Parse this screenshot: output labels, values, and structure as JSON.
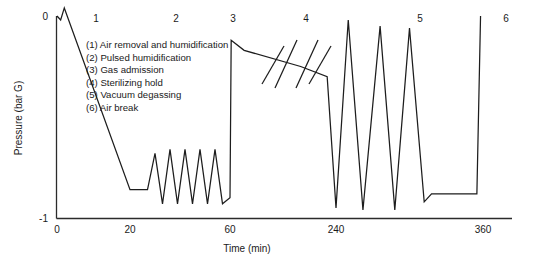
{
  "chart_data": {
    "type": "line",
    "title": "",
    "xlabel": "Time (min)",
    "ylabel": "Pressure (bar G)",
    "ylim": [
      -1,
      0
    ],
    "ytick_labels": [
      "0",
      "-1"
    ],
    "ytick_values": [
      0,
      -1
    ],
    "xtick_labels": [
      "0",
      "20",
      "60",
      "240",
      "360"
    ],
    "xtick_values": [
      0,
      20,
      60,
      240,
      360
    ],
    "grid": false,
    "legend_position": "inside-top-left",
    "axis_break": {
      "present": true,
      "axis": "x",
      "region_label": "4",
      "note": "double slash break symbol drawn across the sterilizing hold plateau"
    },
    "phase_labels": [
      {
        "id": "1",
        "x": 20
      },
      {
        "id": "2",
        "x": 40
      },
      {
        "id": "3",
        "x": 58
      },
      {
        "id": "4",
        "x": 140
      },
      {
        "id": "5",
        "x": 285
      },
      {
        "id": "6",
        "x": 358
      }
    ],
    "legend_entries": [
      "(1) Air removal and humidification",
      "(2) Pulsed humidification",
      "(3) Gas admission",
      "(4) Sterilizing hold",
      "(5) Vacuum degassing",
      "(6) Air break"
    ],
    "series": [
      {
        "name": "Pressure",
        "points": [
          [
            0,
            0.0
          ],
          [
            1,
            -0.02
          ],
          [
            2,
            0.04
          ],
          [
            20,
            -0.86
          ],
          [
            27,
            -0.86
          ],
          [
            30,
            -0.68
          ],
          [
            33,
            -0.93
          ],
          [
            36,
            -0.66
          ],
          [
            39,
            -0.93
          ],
          [
            42,
            -0.66
          ],
          [
            45,
            -0.93
          ],
          [
            48,
            -0.66
          ],
          [
            51,
            -0.93
          ],
          [
            54,
            -0.66
          ],
          [
            57,
            -0.93
          ],
          [
            60,
            -0.9
          ],
          [
            62,
            -0.12
          ],
          [
            84,
            -0.17
          ],
          [
            180,
            -0.25
          ],
          [
            225,
            -0.3
          ],
          [
            240,
            -0.95
          ],
          [
            250,
            -0.02
          ],
          [
            262,
            -0.96
          ],
          [
            276,
            -0.05
          ],
          [
            288,
            -0.96
          ],
          [
            300,
            -0.06
          ],
          [
            312,
            -0.92
          ],
          [
            318,
            -0.88
          ],
          [
            355,
            -0.88
          ],
          [
            358,
            0.0
          ]
        ]
      }
    ]
  },
  "axis": {
    "y_top_label": "0",
    "y_bottom_label": "-1"
  }
}
